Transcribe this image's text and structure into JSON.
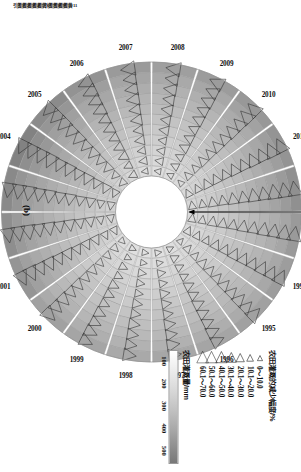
{
  "panel": {
    "label": "(b)"
  },
  "legend": {
    "title": "农田灌溉的减少幅度/%",
    "classes": [
      {
        "label": "0～10.0",
        "size": 3.0
      },
      {
        "label": "10.1～20.0",
        "size": 3.9
      },
      {
        "label": "20.1～30.0",
        "size": 4.8
      },
      {
        "label": "30.1～40.0",
        "size": 5.7
      },
      {
        "label": "40.1～50.0",
        "size": 6.6
      },
      {
        "label": "50.1～60.0",
        "size": 7.5
      },
      {
        "label": "60.1～70.0",
        "size": 8.4
      }
    ],
    "colorbar": {
      "title": "农田灌溉量/mm",
      "ticks": [
        "100",
        "200",
        "300",
        "400",
        "500"
      ]
    }
  },
  "ring_ticks": [
    "引黄11",
    "引黄10",
    "引黄9",
    "引黄8",
    "引黄7",
    "引黄6",
    "引黄5",
    "引黄4",
    "引黄3",
    "引黄2",
    "引黄1"
  ],
  "chart_data": {
    "type": "heatmap",
    "title": "",
    "xlabel": "",
    "ylabel": "",
    "legend_position": "right",
    "grid": true,
    "angular_categories": [
      "1993",
      "1994",
      "1995",
      "1996",
      "1997",
      "1998",
      "1999",
      "2000",
      "2001",
      "2002",
      "2003",
      "2004",
      "2005",
      "2006",
      "2007",
      "2008",
      "2009",
      "2010",
      "2011",
      "2012"
    ],
    "radial_categories": [
      "引黄1",
      "引黄2",
      "引黄3",
      "引黄4",
      "引黄5",
      "引黄6",
      "引黄7",
      "引黄8",
      "引黄9",
      "引黄10",
      "引黄11"
    ],
    "value_label": "农田灌溉量/mm",
    "value_range": [
      100,
      500
    ],
    "marker_label": "农田灌溉的减少幅度/%",
    "marker_range": [
      0,
      70
    ],
    "series": [
      {
        "name": "1993",
        "values": [
          210,
          225,
          240,
          255,
          275,
          290,
          305,
          320,
          340,
          365,
          400
        ],
        "markers": [
          22,
          26,
          30,
          34,
          38,
          42,
          46,
          50,
          55,
          60,
          66
        ]
      },
      {
        "name": "1994",
        "values": [
          205,
          220,
          235,
          250,
          268,
          285,
          300,
          318,
          335,
          358,
          390
        ],
        "markers": [
          20,
          24,
          28,
          32,
          36,
          40,
          44,
          48,
          53,
          58,
          64
        ]
      },
      {
        "name": "1995",
        "values": [
          200,
          212,
          228,
          242,
          258,
          275,
          292,
          308,
          325,
          348,
          378
        ],
        "markers": [
          18,
          22,
          26,
          30,
          34,
          38,
          42,
          46,
          50,
          55,
          60
        ]
      },
      {
        "name": "1996",
        "values": [
          195,
          208,
          222,
          236,
          252,
          268,
          285,
          300,
          318,
          340,
          368
        ],
        "markers": [
          16,
          20,
          24,
          28,
          32,
          36,
          40,
          44,
          48,
          52,
          58
        ]
      },
      {
        "name": "1997",
        "values": [
          190,
          202,
          216,
          230,
          245,
          262,
          278,
          294,
          310,
          332,
          360
        ],
        "markers": [
          14,
          18,
          22,
          26,
          30,
          34,
          38,
          42,
          46,
          50,
          56
        ]
      },
      {
        "name": "1998",
        "values": [
          188,
          200,
          214,
          228,
          243,
          258,
          274,
          290,
          306,
          328,
          355
        ],
        "markers": [
          12,
          16,
          20,
          24,
          28,
          32,
          36,
          40,
          44,
          48,
          54
        ]
      },
      {
        "name": "1999",
        "values": [
          192,
          206,
          220,
          234,
          250,
          266,
          282,
          298,
          316,
          338,
          366
        ],
        "markers": [
          14,
          18,
          23,
          27,
          31,
          35,
          39,
          43,
          47,
          52,
          57
        ]
      },
      {
        "name": "2000",
        "values": [
          198,
          212,
          226,
          242,
          258,
          274,
          290,
          308,
          326,
          350,
          380
        ],
        "markers": [
          16,
          21,
          25,
          29,
          33,
          37,
          41,
          45,
          50,
          55,
          61
        ]
      },
      {
        "name": "2001",
        "values": [
          215,
          232,
          248,
          264,
          282,
          300,
          318,
          336,
          356,
          382,
          415
        ],
        "markers": [
          20,
          25,
          30,
          34,
          38,
          43,
          47,
          52,
          57,
          62,
          68
        ]
      },
      {
        "name": "2002",
        "values": [
          225,
          242,
          258,
          276,
          294,
          312,
          332,
          352,
          374,
          400,
          435
        ],
        "markers": [
          22,
          27,
          32,
          36,
          41,
          45,
          50,
          55,
          60,
          65,
          70
        ]
      },
      {
        "name": "2003",
        "values": [
          232,
          250,
          268,
          286,
          305,
          324,
          344,
          366,
          388,
          415,
          450
        ],
        "markers": [
          24,
          29,
          34,
          38,
          43,
          48,
          52,
          57,
          62,
          67,
          70
        ]
      },
      {
        "name": "2004",
        "values": [
          240,
          258,
          278,
          296,
          316,
          336,
          358,
          380,
          404,
          432,
          470
        ],
        "markers": [
          26,
          31,
          36,
          41,
          46,
          50,
          55,
          60,
          64,
          68,
          70
        ]
      },
      {
        "name": "2005",
        "values": [
          228,
          246,
          264,
          282,
          300,
          320,
          340,
          362,
          384,
          410,
          445
        ],
        "markers": [
          23,
          28,
          33,
          38,
          42,
          47,
          52,
          57,
          61,
          66,
          70
        ]
      },
      {
        "name": "2006",
        "values": [
          215,
          232,
          248,
          266,
          284,
          302,
          322,
          342,
          362,
          388,
          420
        ],
        "markers": [
          20,
          25,
          30,
          35,
          39,
          44,
          48,
          53,
          58,
          63,
          68
        ]
      },
      {
        "name": "2007",
        "values": [
          205,
          220,
          236,
          252,
          270,
          288,
          306,
          325,
          344,
          368,
          398
        ],
        "markers": [
          18,
          23,
          27,
          32,
          36,
          41,
          45,
          50,
          54,
          59,
          64
        ]
      },
      {
        "name": "2008",
        "values": [
          198,
          212,
          228,
          244,
          260,
          278,
          295,
          313,
          332,
          355,
          385
        ],
        "markers": [
          16,
          20,
          25,
          29,
          33,
          38,
          42,
          46,
          51,
          56,
          61
        ]
      },
      {
        "name": "2009",
        "values": [
          202,
          216,
          232,
          248,
          265,
          282,
          300,
          318,
          338,
          362,
          392
        ],
        "markers": [
          17,
          22,
          26,
          30,
          35,
          39,
          43,
          48,
          52,
          57,
          62
        ]
      },
      {
        "name": "2010",
        "values": [
          208,
          224,
          240,
          256,
          274,
          292,
          310,
          330,
          350,
          375,
          406
        ],
        "markers": [
          19,
          24,
          28,
          32,
          37,
          41,
          45,
          50,
          55,
          60,
          65
        ]
      },
      {
        "name": "2011",
        "values": [
          214,
          230,
          246,
          264,
          282,
          300,
          320,
          340,
          360,
          386,
          418
        ],
        "markers": [
          21,
          26,
          30,
          35,
          39,
          44,
          48,
          53,
          58,
          63,
          68
        ]
      },
      {
        "name": "2012",
        "values": [
          218,
          235,
          252,
          270,
          288,
          307,
          327,
          348,
          370,
          396,
          428
        ],
        "markers": [
          22,
          27,
          32,
          36,
          41,
          46,
          50,
          55,
          60,
          65,
          70
        ]
      }
    ]
  }
}
